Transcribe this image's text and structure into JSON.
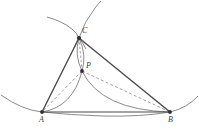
{
  "figure": {
    "type": "euclidean-geometry-diagram",
    "canvas": {
      "width": 199,
      "height": 136,
      "background": "#ffffff"
    }
  },
  "colors": {
    "solid_line": "#4a4a4a",
    "arc_line": "#7d7d7d",
    "dashed_line": "#8a8a8a",
    "vertex_dot": "#2e2e2e",
    "label_text": "#3a3a3a"
  },
  "points": [
    {
      "id": "A",
      "label": "A",
      "x": 42,
      "y": 112,
      "label_x": 39,
      "label_y": 116
    },
    {
      "id": "B",
      "label": "B",
      "x": 170,
      "y": 112,
      "label_x": 168,
      "label_y": 116
    },
    {
      "id": "C",
      "label": "C",
      "x": 79,
      "y": 38,
      "label_x": 82,
      "label_y": 28
    },
    {
      "id": "P",
      "label": "P",
      "x": 82,
      "y": 71,
      "label_x": 86,
      "label_y": 63
    }
  ],
  "segments": [
    {
      "name": "side-AB",
      "from": "A",
      "to": "B",
      "style": "solid"
    },
    {
      "name": "side-AC",
      "from": "A",
      "to": "C",
      "style": "solid"
    },
    {
      "name": "side-CB",
      "from": "C",
      "to": "B",
      "style": "solid"
    }
  ],
  "dashed_segments": [
    {
      "name": "cevian-PA",
      "from": "P",
      "to": "A",
      "style": "dashed"
    },
    {
      "name": "cevian-PB",
      "from": "P",
      "to": "B",
      "style": "dashed"
    },
    {
      "name": "cevian-CP",
      "from": "C",
      "to": "P",
      "style": "dashed"
    }
  ],
  "arcs": [
    {
      "name": "arc-A-to-P",
      "description": "solid grey arc bulging right, from A up to P"
    },
    {
      "name": "arc-B-to-P",
      "description": "solid grey arc bulging left, from B up to P"
    },
    {
      "name": "lens-left-C-to-P",
      "description": "left side of narrow vesica lens joining C and P"
    },
    {
      "name": "lens-right-C-to-P",
      "description": "right side of narrow vesica lens joining C and P"
    },
    {
      "name": "arc-through-A",
      "description": "background arc entering at left edge and passing through A toward B"
    },
    {
      "name": "arc-through-B",
      "description": "background arc passing through B rising to the right edge"
    },
    {
      "name": "arc-upper-left-C",
      "description": "background arc descending from upper-left into C"
    },
    {
      "name": "arc-upper-right-C",
      "description": "background arc rising from C to the top-right"
    },
    {
      "name": "arc-below-C-left",
      "description": "continuation of upper-left arc below C toward lower-right"
    },
    {
      "name": "arc-below-C-right",
      "description": "continuation of upper-right arc below C toward lower-left"
    }
  ]
}
